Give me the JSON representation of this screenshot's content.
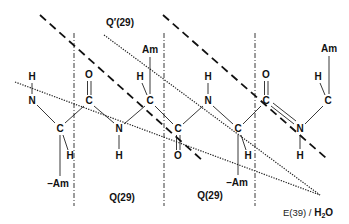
{
  "diagram": {
    "type": "peptide-backbone-schematic",
    "colors": {
      "ink": "#111111",
      "background": "#ffffff"
    },
    "labels": {
      "q_prime": "Q′(29)",
      "q_left": "Q(29)",
      "q_right": "Q(29)",
      "e_site_prefix": "E(39) / ",
      "e_site_h": "H",
      "e_site_sub": "2",
      "e_site_o": "O"
    },
    "atoms": [
      {
        "id": "h1",
        "text": "H",
        "x": 32,
        "y": 80
      },
      {
        "id": "n1",
        "text": "N",
        "x": 32,
        "y": 104
      },
      {
        "id": "ca1",
        "text": "C",
        "x": 60,
        "y": 132
      },
      {
        "id": "ha1",
        "text": "H",
        "x": 70,
        "y": 159
      },
      {
        "id": "am1",
        "text": "–Am",
        "x": 58,
        "y": 187
      },
      {
        "id": "o1",
        "text": "O",
        "x": 89,
        "y": 78
      },
      {
        "id": "c1",
        "text": "C",
        "x": 89,
        "y": 104
      },
      {
        "id": "n2",
        "text": "N",
        "x": 119,
        "y": 132
      },
      {
        "id": "h2",
        "text": "H",
        "x": 119,
        "y": 159
      },
      {
        "id": "ha2",
        "text": "H",
        "x": 140,
        "y": 80
      },
      {
        "id": "ca2",
        "text": "C",
        "x": 150,
        "y": 104
      },
      {
        "id": "am2",
        "text": "Am",
        "x": 150,
        "y": 53
      },
      {
        "id": "c2",
        "text": "C",
        "x": 178,
        "y": 132
      },
      {
        "id": "o2",
        "text": "O",
        "x": 178,
        "y": 159
      },
      {
        "id": "h3",
        "text": "H",
        "x": 208,
        "y": 80
      },
      {
        "id": "n3",
        "text": "N",
        "x": 208,
        "y": 104
      },
      {
        "id": "ca3",
        "text": "C",
        "x": 238,
        "y": 132
      },
      {
        "id": "ha3",
        "text": "H",
        "x": 248,
        "y": 159
      },
      {
        "id": "am3",
        "text": "–Am",
        "x": 237,
        "y": 186
      },
      {
        "id": "o3",
        "text": "O",
        "x": 266,
        "y": 78
      },
      {
        "id": "c3",
        "text": "C",
        "x": 266,
        "y": 104
      },
      {
        "id": "n4",
        "text": "N",
        "x": 300,
        "y": 132
      },
      {
        "id": "h4",
        "text": "H",
        "x": 300,
        "y": 159
      },
      {
        "id": "ha4",
        "text": "H",
        "x": 318,
        "y": 80
      },
      {
        "id": "ca4",
        "text": "C",
        "x": 328,
        "y": 104
      },
      {
        "id": "am4",
        "text": "Am",
        "x": 329,
        "y": 52
      }
    ]
  }
}
